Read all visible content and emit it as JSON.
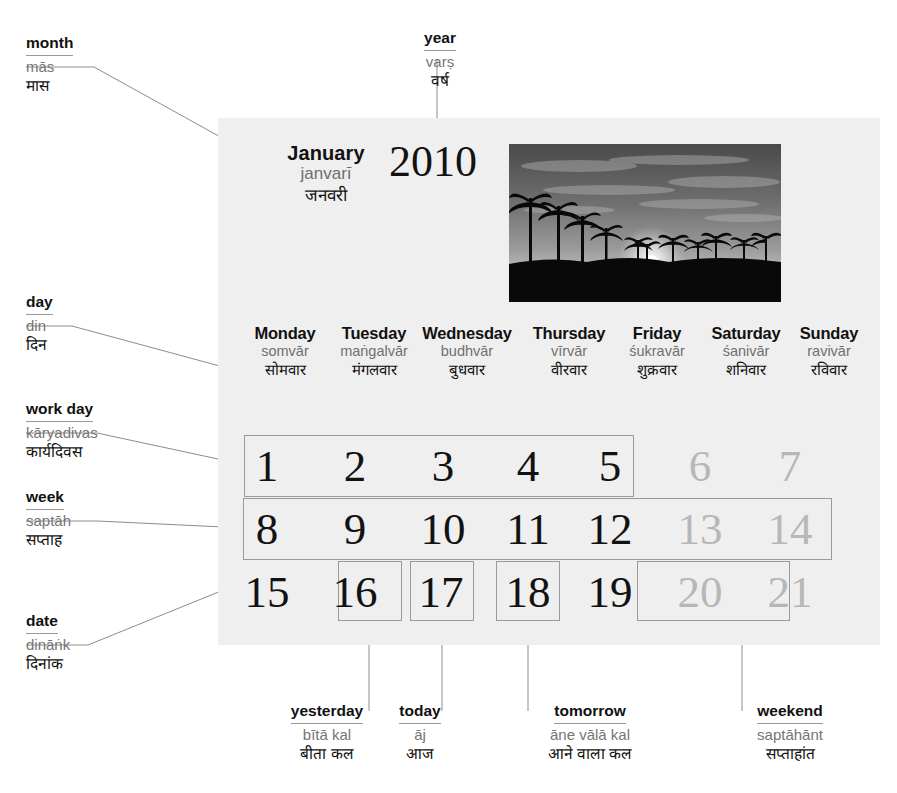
{
  "calendar": {
    "month": {
      "en": "January",
      "translit": "janvarī",
      "hindi": "जनवरी"
    },
    "year": "2010",
    "photo_alt": "palm-trees-sunset-photo",
    "weekdays": [
      {
        "en": "Monday",
        "translit": "somvār",
        "hindi": "सोमवार"
      },
      {
        "en": "Tuesday",
        "translit": "maṅgalvār",
        "hindi": "मंगलवार"
      },
      {
        "en": "Wednesday",
        "translit": "budhvār",
        "hindi": "बुधवार"
      },
      {
        "en": "Thursday",
        "translit": "vīrvār",
        "hindi": "वीरवार"
      },
      {
        "en": "Friday",
        "translit": "śukravār",
        "hindi": "शुक्रवार"
      },
      {
        "en": "Saturday",
        "translit": "śanivār",
        "hindi": "शनिवार"
      },
      {
        "en": "Sunday",
        "translit": "ravivār",
        "hindi": "रविवार"
      }
    ],
    "weeks": [
      [
        "1",
        "2",
        "3",
        "4",
        "5",
        "6",
        "7"
      ],
      [
        "8",
        "9",
        "10",
        "11",
        "12",
        "13",
        "14"
      ],
      [
        "15",
        "16",
        "17",
        "18",
        "19",
        "20",
        "21"
      ]
    ],
    "dimmed_dates": [
      "6",
      "7",
      "13",
      "14",
      "20",
      "21"
    ]
  },
  "labels": {
    "month": {
      "en": "month",
      "translit": "mās",
      "hindi": "मास"
    },
    "year": {
      "en": "year",
      "translit": "varṣ",
      "hindi": "वर्ष"
    },
    "day": {
      "en": "day",
      "translit": "din",
      "hindi": "दिन"
    },
    "workday": {
      "en": "work day",
      "translit": "kāryadivas",
      "hindi": "कार्यदिवस"
    },
    "week": {
      "en": "week",
      "translit": "saptāh",
      "hindi": "सप्ताह"
    },
    "date": {
      "en": "date",
      "translit": "dināṅk",
      "hindi": "दिनांक"
    },
    "yesterday": {
      "en": "yesterday",
      "translit": "bītā kal",
      "hindi": "बीता कल"
    },
    "today": {
      "en": "today",
      "translit": "āj",
      "hindi": "आज"
    },
    "tomorrow": {
      "en": "tomorrow",
      "translit": "āne vālā kal",
      "hindi": "आने वाला कल"
    },
    "weekend": {
      "en": "weekend",
      "translit": "saptāhānt",
      "hindi": "सप्ताहांत"
    }
  },
  "colors": {
    "panel_bg": "#efefef",
    "page_bg": "#ffffff",
    "text": "#121212",
    "translit": "#757575",
    "dimmed_date": "#b7b7b7",
    "rule": "#9a9a9a"
  }
}
